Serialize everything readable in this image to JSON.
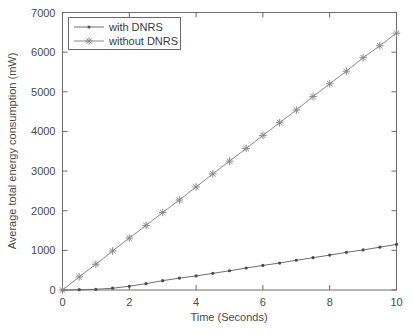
{
  "chart_data": {
    "type": "line",
    "title": "",
    "xlabel": "Time (Seconds)",
    "ylabel": "Average total energy consumption (mW)",
    "xlim": [
      0,
      10
    ],
    "ylim": [
      0,
      7000
    ],
    "xticks": [
      0,
      2,
      4,
      6,
      8,
      10
    ],
    "xtick_labels": [
      "0",
      "2",
      "4",
      "6",
      "8",
      "10"
    ],
    "yticks": [
      0,
      1000,
      2000,
      3000,
      4000,
      5000,
      6000,
      7000
    ],
    "ytick_labels": [
      "0",
      "1000",
      "2000",
      "3000",
      "4000",
      "5000",
      "6000",
      "7000"
    ],
    "grid": false,
    "legend_position": "upper left",
    "x": [
      0,
      0.5,
      1,
      1.5,
      2,
      2.5,
      3,
      3.5,
      4,
      4.5,
      5,
      5.5,
      6,
      6.5,
      7,
      7.5,
      8,
      8.5,
      9,
      9.5,
      10
    ],
    "series": [
      {
        "name": "with DNRS",
        "marker": "dot",
        "color": "#6e6e6e",
        "values": [
          0,
          8,
          18,
          45,
          95,
          160,
          235,
          300,
          355,
          420,
          485,
          555,
          620,
          680,
          750,
          815,
          880,
          950,
          1010,
          1080,
          1150
        ]
      },
      {
        "name": "without DNRS",
        "marker": "star",
        "color": "#8a8a8a",
        "values": [
          0,
          330,
          650,
          985,
          1310,
          1630,
          1955,
          2270,
          2600,
          2930,
          3250,
          3570,
          3900,
          4220,
          4540,
          4880,
          5200,
          5520,
          5860,
          6160,
          6480
        ]
      }
    ]
  },
  "legend": {
    "entries": [
      {
        "label": "with DNRS"
      },
      {
        "label": "without DNRS"
      }
    ]
  },
  "colors": {
    "axis": "#6b6b6b",
    "text": "#4a4a4a",
    "series_with": "#6e6e6e",
    "series_without": "#8a8a8a",
    "background": "#ffffff"
  }
}
